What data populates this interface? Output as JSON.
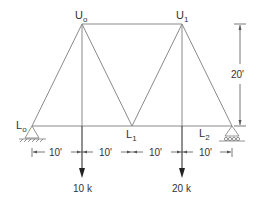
{
  "diagram": {
    "type": "truss",
    "nodes": {
      "U0": {
        "base": "U",
        "sub": "o"
      },
      "U1": {
        "base": "U",
        "sub": "1"
      },
      "L0": {
        "base": "L",
        "sub": "o"
      },
      "L1": {
        "base": "L",
        "sub": "1"
      },
      "L2": {
        "base": "L",
        "sub": "2"
      }
    },
    "dimensions": {
      "horizontal": [
        "10'",
        "10'",
        "10'",
        "10'"
      ],
      "vertical": "20'"
    },
    "loads": [
      {
        "label": "10 k"
      },
      {
        "label": "20 k"
      }
    ],
    "supports": {
      "left": "pin",
      "right": "roller"
    },
    "colors": {
      "member": "#8a8a8a",
      "text": "#333333",
      "load_arrow": "#222222"
    }
  }
}
